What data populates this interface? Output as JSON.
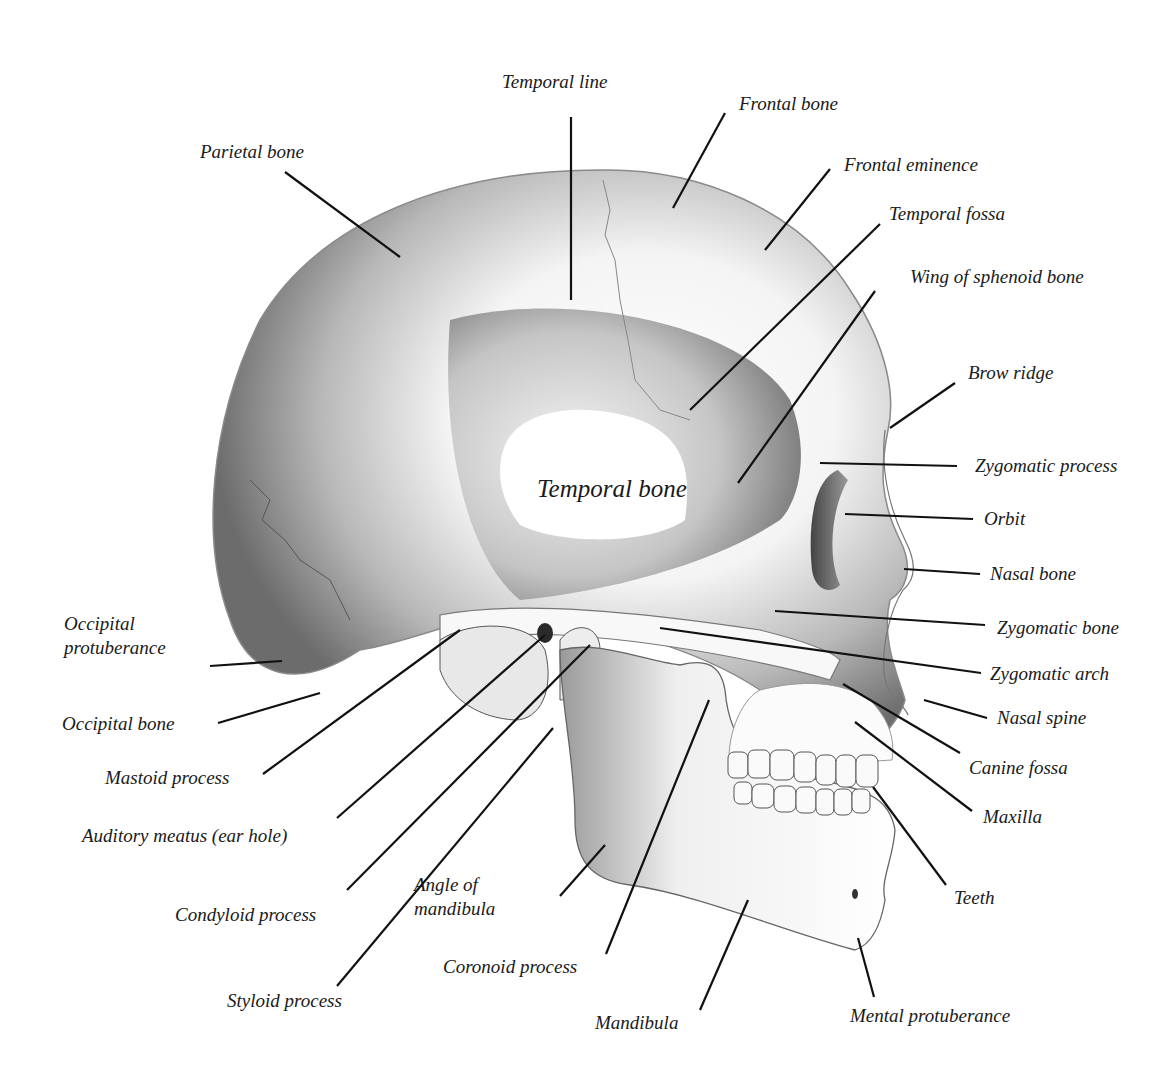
{
  "diagram": {
    "central_label": {
      "text": "Temporal bone",
      "x": 537,
      "y": 478
    },
    "labels": [
      {
        "id": "temporal-line",
        "text": "Temporal line",
        "x": 502,
        "y": 71,
        "line": [
          571,
          117,
          571,
          300
        ]
      },
      {
        "id": "frontal-bone",
        "text": "Frontal bone",
        "x": 739,
        "y": 93,
        "line": [
          725,
          113,
          673,
          208
        ]
      },
      {
        "id": "parietal-bone",
        "text": "Parietal bone",
        "x": 200,
        "y": 141,
        "line": [
          285,
          172,
          400,
          257
        ]
      },
      {
        "id": "frontal-eminence",
        "text": "Frontal eminence",
        "x": 844,
        "y": 154,
        "line": [
          830,
          169,
          765,
          250
        ]
      },
      {
        "id": "temporal-fossa",
        "text": "Temporal fossa",
        "x": 889,
        "y": 203,
        "line": [
          880,
          224,
          690,
          410
        ]
      },
      {
        "id": "wing-of-sphenoid-bone",
        "text": "Wing of  sphenoid bone",
        "x": 910,
        "y": 266,
        "line": [
          875,
          291,
          738,
          483
        ]
      },
      {
        "id": "brow-ridge",
        "text": "Brow ridge",
        "x": 968,
        "y": 362,
        "line": [
          955,
          383,
          890,
          428
        ]
      },
      {
        "id": "zygomatic-process",
        "text": "Zygomatic process",
        "x": 975,
        "y": 455,
        "line": [
          820,
          463,
          957,
          466
        ]
      },
      {
        "id": "orbit",
        "text": "Orbit",
        "x": 984,
        "y": 508,
        "line": [
          845,
          514,
          973,
          519
        ]
      },
      {
        "id": "nasal-bone",
        "text": "Nasal bone",
        "x": 990,
        "y": 563,
        "line": [
          904,
          569,
          980,
          574
        ]
      },
      {
        "id": "occipital-protuberance",
        "text": "Occipital\nprotuberance",
        "x": 64,
        "y": 612,
        "line": [
          210,
          666,
          282,
          661
        ]
      },
      {
        "id": "zygomatic-bone",
        "text": "Zygomatic bone",
        "x": 997,
        "y": 617,
        "line": [
          775,
          611,
          985,
          625
        ]
      },
      {
        "id": "zygomatic-arch",
        "text": "Zygomatic arch",
        "x": 990,
        "y": 663,
        "line": [
          660,
          628,
          981,
          673
        ]
      },
      {
        "id": "occipital-bone",
        "text": "Occipital bone",
        "x": 62,
        "y": 713,
        "line": [
          218,
          723,
          320,
          693
        ]
      },
      {
        "id": "nasal-spine",
        "text": "Nasal spine",
        "x": 997,
        "y": 707,
        "line": [
          924,
          700,
          987,
          718
        ]
      },
      {
        "id": "mastoid-process",
        "text": "Mastoid process",
        "x": 105,
        "y": 767,
        "line": [
          263,
          774,
          460,
          630
        ]
      },
      {
        "id": "canine-fossa",
        "text": "Canine fossa",
        "x": 969,
        "y": 757,
        "line": [
          843,
          684,
          960,
          753
        ]
      },
      {
        "id": "maxilla",
        "text": "Maxilla",
        "x": 983,
        "y": 806,
        "line": [
          855,
          722,
          972,
          811
        ]
      },
      {
        "id": "auditory-meatus",
        "text": "Auditory meatus (ear hole)",
        "x": 82,
        "y": 825,
        "line": [
          337,
          818,
          545,
          635
        ]
      },
      {
        "id": "teeth",
        "text": "Teeth",
        "x": 954,
        "y": 887,
        "line": [
          873,
          787,
          946,
          885
        ]
      },
      {
        "id": "angle-of-mandibula",
        "text": "Angle of\nmandibula",
        "x": 414,
        "y": 873,
        "line": [
          560,
          896,
          605,
          845
        ]
      },
      {
        "id": "condyloid-process",
        "text": "Condyloid process",
        "x": 175,
        "y": 904,
        "line": [
          347,
          890,
          590,
          645
        ]
      },
      {
        "id": "coronoid-process",
        "text": "Coronoid process",
        "x": 443,
        "y": 956,
        "line": [
          606,
          954,
          709,
          700
        ]
      },
      {
        "id": "styloid-process",
        "text": "Styloid process",
        "x": 227,
        "y": 990,
        "line": [
          337,
          986,
          553,
          728
        ]
      },
      {
        "id": "mandibula",
        "text": "Mandibula",
        "x": 595,
        "y": 1012,
        "line": [
          700,
          1010,
          748,
          900
        ]
      },
      {
        "id": "mental-protuberance",
        "text": "Mental protuberance",
        "x": 850,
        "y": 1005,
        "line": [
          874,
          997,
          858,
          938
        ]
      }
    ]
  }
}
